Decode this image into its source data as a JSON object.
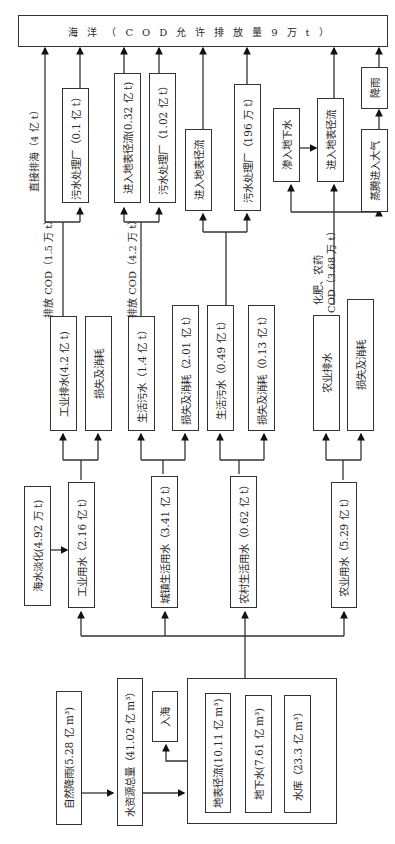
{
  "diagram": {
    "orientation": "rotated-90-ccw",
    "sources": {
      "natural_rainfall": "自然降雨(5.28 亿 m³)",
      "total_water_resources": "水资源总量（41.02 亿 m³）",
      "into_sea": "入海",
      "surface_runoff": "地表径流(10.11 亿 m³)",
      "groundwater": "地下水(7.61 亿 m³)",
      "reservoir": "水库（23.3 亿 m³）"
    },
    "desalination": "海水淡化(4.92 万 t)",
    "uses": {
      "industrial": "工业用水（2.16 亿 t）",
      "urban_domestic": "城镇生活用水（3.41 亿 t）",
      "rural_domestic": "农村生活用水（0.62 亿 t）",
      "agricultural": "农业用水（5.29 亿 t）"
    },
    "outputs": {
      "industrial_discharge": "工业排水(4.2 亿 t)",
      "industrial_loss": "损失及消耗",
      "urban_sewage": "生活污水（1.4 亿 t）",
      "urban_loss": "损失及消耗（2.01 亿 t）",
      "rural_sewage": "生活污水（0.49 亿 t）",
      "rural_loss": "损失及消耗（0.13 亿 t）",
      "agri_drainage": "农业排水",
      "agri_loss": "损失及消耗"
    },
    "edge_labels": {
      "industrial_cod": "排放 COD（1.5 万 t）",
      "urban_cod": "排放 COD（4.2 万 t）",
      "agri_cod_line1": "化肥、农药",
      "agri_cod_line2": "COD（3.68 万 t）",
      "direct_discharge": "直接排海（4 亿 t）"
    },
    "destinations": {
      "ind_treatment": "污水处理厂（0.1 亿 t）",
      "urban_runoff": "进入地表径流(0.32 亿 t)",
      "urban_treatment": "污水处理厂（1.02 亿 t）",
      "rural_runoff": "进入地表径流",
      "rural_treatment": "污水处理厂（196 万 t）",
      "agri_infiltrate": "渗入地下水",
      "agri_runoff": "进入地表径流",
      "agri_evaporate": "蒸腾进入大气",
      "agri_rain": "降雨"
    },
    "ocean": "海洋（COD允许排放量9万t）"
  }
}
